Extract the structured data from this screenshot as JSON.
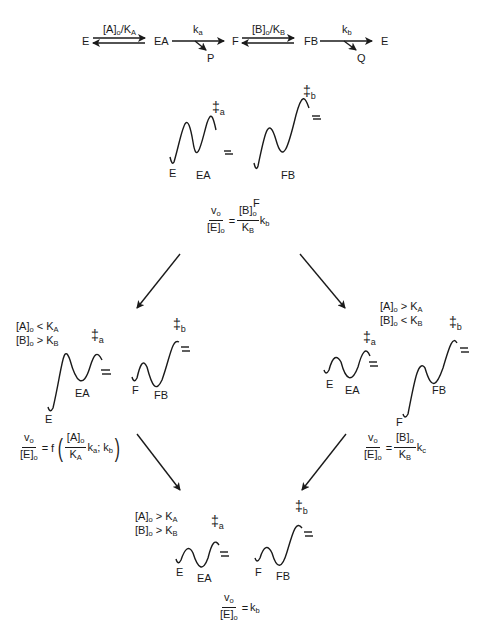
{
  "scheme": {
    "species": [
      "E",
      "EA",
      "F",
      "FB",
      "E"
    ],
    "products": [
      "P",
      "Q"
    ],
    "step1_label": {
      "main": "[A]",
      "sub1": "o",
      "mid": "/K",
      "sub2": "A"
    },
    "step2_label": {
      "main": "k",
      "sub": "a"
    },
    "step3_label": {
      "main": "[B]",
      "sub1": "o",
      "mid": "/K",
      "sub2": "B"
    },
    "step4_label": {
      "main": "k",
      "sub": "b"
    }
  },
  "ts_symbol": "‡",
  "ts_a_sub": "a",
  "ts_b_sub": "b",
  "panels": {
    "top": {
      "curve_labels": {
        "e": "E",
        "ea": "EA",
        "f": "F",
        "fb": "FB"
      },
      "equation": {
        "v": "v",
        "v_sub": "o",
        "e": "[E]",
        "e_sub": "o",
        "eq": "=",
        "rhs_num": "[B]",
        "rhs_num_sub": "o",
        "rhs_den": "K",
        "rhs_den_sub": "B",
        "k": "k",
        "k_sub": "b"
      }
    },
    "left": {
      "condition1": {
        "a": "[A]",
        "a_sub": "o",
        "op": "<",
        "k": "K",
        "k_sub": "A"
      },
      "condition2": {
        "a": "[B]",
        "a_sub": "o",
        "op": ">",
        "k": "K",
        "k_sub": "B"
      },
      "curve_labels": {
        "e": "E",
        "ea": "EA",
        "f": "F",
        "fb": "FB"
      },
      "equation": {
        "v": "v",
        "v_sub": "o",
        "e": "[E]",
        "e_sub": "o",
        "eq": "= f",
        "num": "[A]",
        "num_sub": "o",
        "den": "K",
        "den_sub": "A",
        "k1": "k",
        "k1_sub": "a",
        "sep": ";",
        "k2": "k",
        "k2_sub": "b"
      }
    },
    "right": {
      "condition1": {
        "a": "[A]",
        "a_sub": "o",
        "op": ">",
        "k": "K",
        "k_sub": "A"
      },
      "condition2": {
        "a": "[B]",
        "a_sub": "o",
        "op": "<",
        "k": "K",
        "k_sub": "B"
      },
      "curve_labels": {
        "e": "E",
        "ea": "EA",
        "f": "F",
        "fb": "FB"
      },
      "equation": {
        "v": "v",
        "v_sub": "o",
        "e": "[E]",
        "e_sub": "o",
        "eq": "=",
        "rhs_num": "[B]",
        "rhs_num_sub": "o",
        "rhs_den": "K",
        "rhs_den_sub": "B",
        "k": "k",
        "k_sub": "c"
      }
    },
    "bottom": {
      "condition1": {
        "a": "[A]",
        "a_sub": "o",
        "op": ">",
        "k": "K",
        "k_sub": "A"
      },
      "condition2": {
        "a": "[B]",
        "a_sub": "o",
        "op": ">",
        "k": "K",
        "k_sub": "B"
      },
      "curve_labels": {
        "e": "E",
        "ea": "EA",
        "f": "F",
        "fb": "FB"
      },
      "equation": {
        "v": "v",
        "v_sub": "o",
        "e": "[E]",
        "e_sub": "o",
        "eq": "=",
        "k": "k",
        "k_sub": "b"
      }
    }
  }
}
